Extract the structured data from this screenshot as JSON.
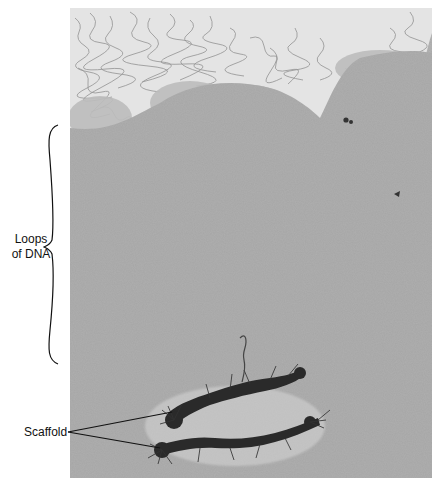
{
  "figure": {
    "labels": {
      "loops_line1": "Loops",
      "loops_line2": "of DNA",
      "scaffold": "Scaffold"
    },
    "colors": {
      "background": "#ffffff",
      "micrograph_gray": "#a9a9a9",
      "loop_region_light": "#dedede",
      "scaffold_dark": "#2a2a2a",
      "annotation_ink": "#111111"
    }
  }
}
